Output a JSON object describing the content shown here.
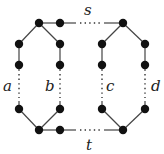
{
  "diagram": {
    "type": "graph",
    "labels": {
      "s": "s",
      "t": "t",
      "a": "a",
      "b": "b",
      "c": "c",
      "d": "d"
    },
    "nodes": [
      {
        "id": "top-left-hub",
        "x": 39,
        "y": 23
      },
      {
        "id": "top-s-start",
        "x": 60,
        "y": 23
      },
      {
        "id": "top-right-hub",
        "x": 123,
        "y": 23
      },
      {
        "id": "a-top-1",
        "x": 19,
        "y": 44
      },
      {
        "id": "a-top-2",
        "x": 19,
        "y": 65
      },
      {
        "id": "b-top-1",
        "x": 60,
        "y": 44
      },
      {
        "id": "b-top-2",
        "x": 60,
        "y": 65
      },
      {
        "id": "c-top-1",
        "x": 102,
        "y": 44
      },
      {
        "id": "c-top-2",
        "x": 102,
        "y": 65
      },
      {
        "id": "d-top-1",
        "x": 145,
        "y": 44
      },
      {
        "id": "d-top-2",
        "x": 145,
        "y": 65
      },
      {
        "id": "a-bottom",
        "x": 19,
        "y": 109
      },
      {
        "id": "b-bottom",
        "x": 60,
        "y": 109
      },
      {
        "id": "c-bottom",
        "x": 102,
        "y": 109
      },
      {
        "id": "d-bottom",
        "x": 145,
        "y": 109
      },
      {
        "id": "bottom-left-hub",
        "x": 39,
        "y": 130
      },
      {
        "id": "bottom-t-start",
        "x": 60,
        "y": 130
      },
      {
        "id": "bottom-right-hub",
        "x": 123,
        "y": 130
      }
    ],
    "paths": [
      {
        "name": "s",
        "description": "dotted path between top hubs"
      },
      {
        "name": "t",
        "description": "dotted path between bottom hubs"
      },
      {
        "name": "a",
        "description": "dotted path left outer"
      },
      {
        "name": "b",
        "description": "dotted path left inner"
      },
      {
        "name": "c",
        "description": "dotted path right inner"
      },
      {
        "name": "d",
        "description": "dotted path right outer"
      }
    ]
  }
}
